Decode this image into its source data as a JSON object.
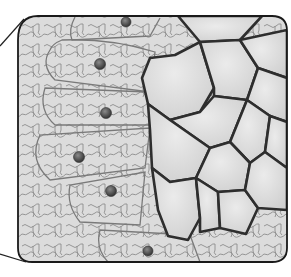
{
  "figure": {
    "colors": {
      "background": "#ffffff",
      "cell_fill": "#d9d9d9",
      "cell_fill_light": "#e4e4e4",
      "wavy_wall": "#8a8a8a",
      "thick_wall": "#2e2e2e",
      "frame": "#1a1a1a",
      "nucleus": "#4a4a4a"
    },
    "nuclei_count": 6,
    "callout_lines": 2
  }
}
